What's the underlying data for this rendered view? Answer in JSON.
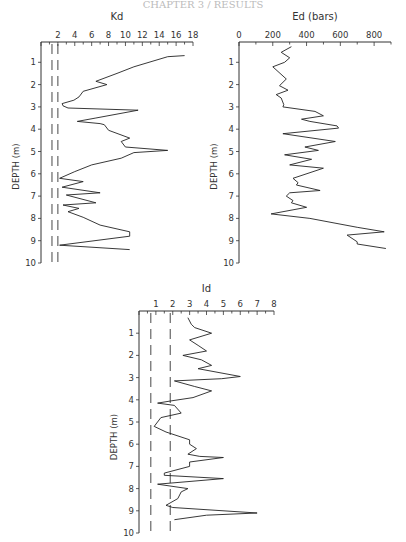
{
  "header": {
    "text": "CHAPTER 3 / RESULTS"
  },
  "chart_data": [
    {
      "type": "line",
      "title": "Kd",
      "xlabel": "Kd",
      "ylabel": "DEPTH (m)",
      "xticks": [
        2,
        4,
        6,
        8,
        10,
        12,
        14,
        16,
        18
      ],
      "yticks": [
        1,
        2,
        3,
        4,
        5,
        6,
        7,
        8,
        9,
        10
      ],
      "xlim": [
        0,
        18
      ],
      "ylim": [
        10,
        0
      ],
      "reference_lines_x": [
        1.3,
        2.0
      ],
      "depth": [
        0.7,
        0.75,
        1.2,
        1.5,
        1.85,
        2.0,
        2.3,
        2.55,
        2.7,
        2.85,
        2.95,
        3.05,
        3.15,
        3.5,
        3.65,
        3.75,
        3.8,
        4.05,
        4.4,
        4.55,
        4.8,
        4.95,
        5.05,
        5.3,
        5.6,
        5.9,
        6.2,
        6.35,
        6.6,
        6.85,
        6.95,
        7.3,
        7.4,
        7.55,
        7.7,
        7.95,
        8.3,
        8.6,
        8.8,
        9.2,
        9.4
      ],
      "values": [
        17.0,
        15.0,
        11.0,
        9.0,
        6.5,
        7.8,
        5.0,
        4.5,
        3.9,
        2.5,
        2.6,
        3.2,
        11.5,
        6.5,
        4.3,
        7.0,
        7.5,
        8.0,
        10.5,
        9.5,
        10.0,
        15.0,
        11.0,
        9.5,
        6.0,
        4.0,
        2.2,
        5.0,
        2.5,
        7.0,
        3.0,
        6.5,
        2.6,
        4.5,
        3.2,
        5.0,
        7.0,
        10.5,
        10.5,
        2.2,
        10.5
      ]
    },
    {
      "type": "line",
      "title": "Ed (bars)",
      "xlabel": "Ed (bars)",
      "ylabel": "DEPTH (m)",
      "xticks": [
        0,
        200,
        400,
        600,
        800
      ],
      "yticks": [
        1,
        2,
        3,
        4,
        5,
        6,
        7,
        8,
        9,
        10
      ],
      "xlim": [
        0,
        900
      ],
      "ylim": [
        10,
        0
      ],
      "depth": [
        0.3,
        0.55,
        0.8,
        1.0,
        1.2,
        1.75,
        2.05,
        2.25,
        2.45,
        2.6,
        2.9,
        3.0,
        3.2,
        3.4,
        3.55,
        3.65,
        3.85,
        3.95,
        4.2,
        4.55,
        4.8,
        4.95,
        5.15,
        5.35,
        5.6,
        5.75,
        6.2,
        6.4,
        6.5,
        6.75,
        6.85,
        7.0,
        7.2,
        7.3,
        7.5,
        7.8,
        8.0,
        8.4,
        8.6,
        8.75,
        9.05,
        9.15,
        9.35
      ],
      "values": [
        310,
        250,
        300,
        270,
        200,
        280,
        240,
        290,
        220,
        250,
        265,
        260,
        450,
        500,
        370,
        420,
        580,
        590,
        260,
        570,
        390,
        470,
        270,
        430,
        300,
        500,
        320,
        350,
        340,
        480,
        300,
        280,
        320,
        310,
        400,
        190,
        420,
        700,
        860,
        640,
        700,
        700,
        870
      ]
    },
    {
      "type": "line",
      "title": "Id",
      "xlabel": "Id",
      "ylabel": "DEPTH (m)",
      "xticks": [
        1,
        2,
        3,
        4,
        5,
        6,
        7,
        8
      ],
      "yticks": [
        1,
        2,
        3,
        4,
        5,
        6,
        7,
        8,
        9,
        10
      ],
      "xlim": [
        0,
        8
      ],
      "ylim": [
        10,
        0
      ],
      "reference_lines_x": [
        0.7,
        1.85
      ],
      "depth": [
        0.3,
        0.6,
        0.75,
        1.0,
        1.3,
        1.55,
        1.8,
        2.0,
        2.2,
        2.45,
        2.6,
        2.95,
        3.05,
        3.15,
        3.4,
        3.6,
        3.9,
        4.05,
        4.15,
        4.25,
        4.6,
        4.8,
        5.2,
        5.45,
        5.8,
        6.0,
        6.2,
        6.45,
        6.55,
        6.6,
        6.8,
        7.0,
        7.3,
        7.4,
        7.55,
        7.8,
        8.0,
        8.15,
        8.45,
        8.75,
        8.85,
        9.1,
        9.2,
        9.4
      ],
      "values": [
        2.9,
        3.1,
        3.3,
        4.3,
        3.0,
        3.5,
        4.0,
        2.6,
        3.7,
        4.3,
        3.5,
        6.0,
        4.9,
        2.1,
        3.3,
        4.3,
        3.2,
        1.9,
        1.1,
        2.1,
        2.5,
        1.3,
        0.9,
        1.6,
        3.0,
        3.0,
        3.4,
        2.9,
        3.6,
        5.0,
        3.0,
        3.0,
        1.5,
        1.5,
        5.0,
        1.1,
        2.9,
        2.5,
        2.3,
        1.6,
        2.0,
        7.0,
        4.0,
        2.1
      ]
    }
  ]
}
